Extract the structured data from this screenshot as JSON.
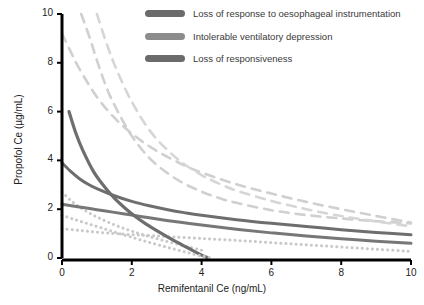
{
  "chart_data": {
    "type": "line",
    "title": "",
    "xlabel": "Remifentanil Ce (ng/mL)",
    "ylabel": "Propofol Ce (µg/mL)",
    "xlim": [
      0,
      10
    ],
    "ylim": [
      0,
      10
    ],
    "xticks": [
      0,
      2,
      4,
      6,
      8,
      10
    ],
    "yticks": [
      0,
      2,
      4,
      6,
      8,
      10
    ],
    "grid": false,
    "legend_position": "top-right",
    "series": [
      {
        "name": "Loss of response to oesophageal instrumentation",
        "style": "dashed",
        "color": "#d0d0d0",
        "linewidth": 2.6,
        "x": [
          0.55,
          0.8,
          1.0,
          1.3,
          1.6,
          2.0,
          2.5,
          3.0,
          3.5,
          4.0,
          4.5,
          5.0,
          6.0,
          7.0,
          8.0,
          9.0,
          10.0
        ],
        "y": [
          10.0,
          9.0,
          8.1,
          6.9,
          6.0,
          5.0,
          4.1,
          3.5,
          3.05,
          2.72,
          2.46,
          2.26,
          1.96,
          1.76,
          1.62,
          1.51,
          1.42
        ]
      },
      {
        "name": "Loss of response to oesophageal instrumentation",
        "style": "solid",
        "color": "#6e6e6e",
        "linewidth": 3.0,
        "x": [
          0.0,
          0.25,
          0.5,
          0.75,
          1.0,
          1.5,
          2.0,
          2.5,
          3.0,
          3.5,
          4.0,
          5.0,
          6.0,
          7.0,
          8.0,
          9.0,
          10.0
        ],
        "y": [
          3.9,
          3.55,
          3.25,
          3.02,
          2.84,
          2.55,
          2.32,
          2.14,
          1.99,
          1.86,
          1.75,
          1.57,
          1.42,
          1.29,
          1.16,
          1.05,
          0.95
        ]
      },
      {
        "name": "Loss of response to oesophageal instrumentation",
        "style": "dotted",
        "color": "#c9c9c9",
        "linewidth": 3.0,
        "x": [
          0.0,
          0.3,
          0.6,
          1.0,
          1.5,
          2.0,
          2.5,
          3.0,
          3.5,
          4.0
        ],
        "y": [
          2.7,
          2.3,
          2.0,
          1.68,
          1.36,
          1.1,
          0.88,
          0.68,
          0.5,
          0.32
        ]
      },
      {
        "name": "Intolerable ventilatory depression",
        "style": "dashed",
        "color": "#d0d0d0",
        "linewidth": 2.6,
        "x": [
          0.0,
          0.2,
          0.5,
          1.0,
          1.5,
          2.0,
          2.5,
          3.0,
          3.5,
          4.0,
          5.0,
          6.0,
          7.0,
          8.0,
          9.0,
          10.0
        ],
        "y": [
          9.2,
          8.6,
          7.75,
          6.6,
          5.75,
          5.1,
          4.58,
          4.16,
          3.8,
          3.5,
          3.02,
          2.64,
          2.3,
          2.0,
          1.72,
          1.45
        ]
      },
      {
        "name": "Intolerable ventilatory depression",
        "style": "solid",
        "color": "#777777",
        "linewidth": 3.0,
        "x": [
          0.0,
          0.5,
          1.0,
          1.5,
          2.0,
          2.5,
          3.0,
          3.5,
          4.0,
          5.0,
          6.0,
          7.0,
          8.0,
          9.0,
          10.0
        ],
        "y": [
          2.2,
          2.09,
          1.98,
          1.87,
          1.76,
          1.65,
          1.54,
          1.44,
          1.35,
          1.18,
          1.03,
          0.9,
          0.79,
          0.69,
          0.6
        ]
      },
      {
        "name": "Intolerable ventilatory depression",
        "style": "dotted",
        "color": "#c9c9c9",
        "linewidth": 3.0,
        "x": [
          0.0,
          0.5,
          1.0,
          1.5,
          2.0,
          2.5,
          3.0,
          4.0,
          5.0,
          6.0,
          7.0,
          8.0,
          9.0,
          10.0
        ],
        "y": [
          1.2,
          1.13,
          1.06,
          1.0,
          0.96,
          0.92,
          0.88,
          0.8,
          0.72,
          0.63,
          0.54,
          0.45,
          0.36,
          0.27
        ]
      },
      {
        "name": "Loss of responsiveness",
        "style": "dashed",
        "color": "#d6d6d6",
        "linewidth": 2.6,
        "x": [
          1.0,
          1.3,
          1.6,
          2.0,
          2.5,
          3.0,
          3.5,
          4.0,
          4.5,
          5.0,
          6.0,
          7.0,
          8.0,
          9.0,
          10.0
        ],
        "y": [
          10.0,
          8.7,
          7.6,
          6.4,
          5.25,
          4.45,
          3.85,
          3.4,
          3.05,
          2.76,
          2.34,
          2.0,
          1.72,
          1.5,
          1.3
        ]
      },
      {
        "name": "Loss of responsiveness",
        "style": "solid",
        "color": "#6e6e6e",
        "linewidth": 3.2,
        "x": [
          0.2,
          0.4,
          0.6,
          0.9,
          1.2,
          1.5,
          1.8,
          2.1,
          2.4,
          2.8,
          3.2,
          3.6,
          4.0,
          4.2
        ],
        "y": [
          6.0,
          5.1,
          4.4,
          3.55,
          2.95,
          2.45,
          2.05,
          1.7,
          1.4,
          1.05,
          0.72,
          0.42,
          0.12,
          0.0
        ]
      },
      {
        "name": "Loss of responsiveness",
        "style": "dotted",
        "color": "#c9c9c9",
        "linewidth": 3.0,
        "x": [
          0.0,
          0.4,
          0.8,
          1.2,
          1.6,
          2.0,
          2.4,
          2.8,
          3.2,
          3.6,
          4.0,
          4.3
        ],
        "y": [
          1.75,
          1.56,
          1.38,
          1.2,
          1.02,
          0.85,
          0.68,
          0.52,
          0.37,
          0.22,
          0.08,
          0.0
        ]
      }
    ],
    "legend": [
      {
        "label": "Loss of response to oesophageal instrumentation",
        "color": "#6b6b6b"
      },
      {
        "label": "Intolerable ventilatory depression",
        "color": "#8c8c8c"
      },
      {
        "label": "Loss of responsiveness",
        "color": "#6b6b6b"
      }
    ]
  },
  "axes": {
    "x_title": "Remifentanil Ce (ng/mL)",
    "y_title": "Propofol Ce (µg/mL)",
    "x_ticks": [
      "0",
      "2",
      "4",
      "6",
      "8",
      "10"
    ],
    "y_ticks": [
      "0",
      "2",
      "4",
      "6",
      "8",
      "10"
    ],
    "axis_color": "#000000"
  }
}
